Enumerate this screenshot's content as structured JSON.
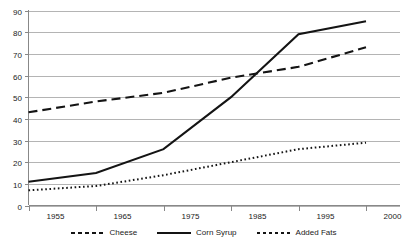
{
  "chart_data": {
    "type": "line",
    "title": "",
    "xlabel": "",
    "ylabel": "",
    "categories": [
      "1955",
      "1965",
      "1975",
      "1985",
      "1995",
      "2000"
    ],
    "ylim": [
      0,
      90
    ],
    "yticks": [
      "0",
      "10",
      "20",
      "30",
      "40",
      "50",
      "60",
      "70",
      "80",
      "90"
    ],
    "grid": "horizontal",
    "legend_position": "bottom",
    "series": [
      {
        "name": "Cheese",
        "style": "dashed",
        "values": [
          43,
          48,
          52,
          59,
          64,
          73
        ]
      },
      {
        "name": "Corn Syrup",
        "style": "solid",
        "values": [
          11,
          15,
          26,
          50,
          79,
          85
        ]
      },
      {
        "name": "Added Fats",
        "style": "dotted",
        "values": [
          7,
          9,
          14,
          20,
          26,
          29
        ]
      }
    ],
    "colors": {
      "series_line": "#141414",
      "gridline": "#b4b4b4",
      "axis": "#888888",
      "background": "#ffffff",
      "text": "#1a1a1a"
    }
  }
}
